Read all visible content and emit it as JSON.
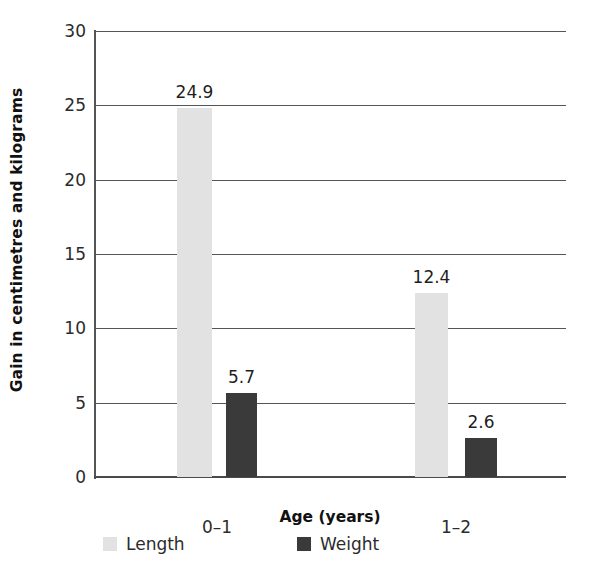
{
  "chart_data": {
    "type": "bar",
    "title": "",
    "subtitle": "",
    "categories": [
      "0–1",
      "1–2"
    ],
    "series": [
      {
        "name": "Length",
        "values": [
          24.9,
          12.4
        ],
        "color": "#e2e2e2"
      },
      {
        "name": "Weight",
        "values": [
          5.7,
          2.6
        ],
        "color": "#3a3a3a"
      }
    ],
    "xlabel": "Age (years)",
    "ylabel": "Gain in centimetres and kilograms",
    "ylim": [
      0,
      30
    ],
    "yticks": [
      0,
      5,
      10,
      15,
      20,
      25,
      30
    ],
    "ytick_labels": [
      "0",
      "5",
      "10",
      "15",
      "20",
      "25",
      "30"
    ],
    "data_labels": [
      "24.9",
      "5.7",
      "12.4",
      "2.6"
    ],
    "grid": "horizontal",
    "legend_position": "bottom",
    "axis_color": "#555555",
    "text_color": "#2b2b2b"
  },
  "axes": {
    "y_title": "Gain in centimetres and kilograms",
    "x_title": "Age (years)",
    "y_ticks": [
      {
        "value": 30,
        "label": "30"
      },
      {
        "value": 25,
        "label": "25"
      },
      {
        "value": 20,
        "label": "20"
      },
      {
        "value": 15,
        "label": "15"
      },
      {
        "value": 10,
        "label": "10"
      },
      {
        "value": 5,
        "label": "5"
      },
      {
        "value": 0,
        "label": "0"
      }
    ],
    "x_ticks": [
      {
        "label": "0–1"
      },
      {
        "label": "1–2"
      }
    ]
  },
  "bars": [
    {
      "group": "0–1",
      "series": "Length",
      "value": 24.9,
      "label": "24.9"
    },
    {
      "group": "0–1",
      "series": "Weight",
      "value": 5.7,
      "label": "5.7"
    },
    {
      "group": "1–2",
      "series": "Length",
      "value": 12.4,
      "label": "12.4"
    },
    {
      "group": "1–2",
      "series": "Weight",
      "value": 2.6,
      "label": "2.6"
    }
  ],
  "legend": {
    "items": [
      {
        "label": "Length",
        "color": "#e2e2e2"
      },
      {
        "label": "Weight",
        "color": "#3a3a3a"
      }
    ]
  }
}
